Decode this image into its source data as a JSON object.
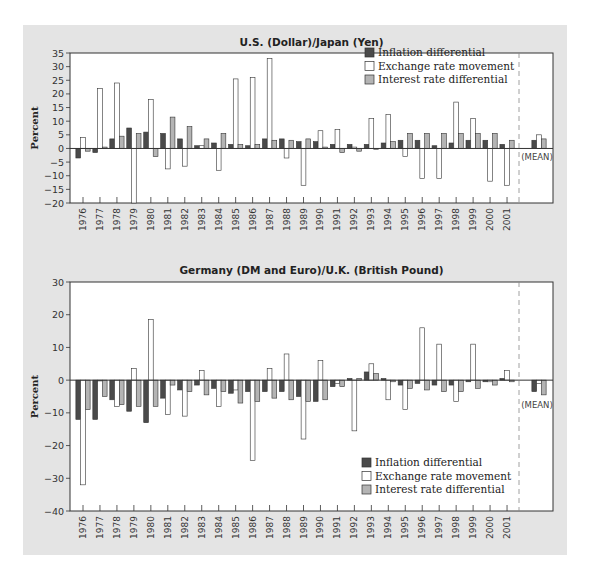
{
  "colors": {
    "inflation": "#4a4a4a",
    "exchange": "#ffffff",
    "interest": "#b4b4b4",
    "panel": "#e4e4e4",
    "outline": "#333333"
  },
  "chart_data": [
    {
      "type": "bar",
      "title": "U.S. (Dollar)/Japan (Yen)",
      "xlabel": "",
      "ylabel": "Percent",
      "ylim": [
        -20,
        35
      ],
      "yticks": [
        35,
        30,
        25,
        20,
        15,
        10,
        5,
        0,
        -5,
        -10,
        -15,
        -20
      ],
      "grid": false,
      "legend_position": "top-right",
      "mean_label": "(MEAN)",
      "categories": [
        "1976",
        "1977",
        "1978",
        "1979",
        "1980",
        "1981",
        "1982",
        "1983",
        "1984",
        "1985",
        "1986",
        "1987",
        "1988",
        "1989",
        "1990",
        "1991",
        "1992",
        "1993",
        "1994",
        "1995",
        "1996",
        "1997",
        "1998",
        "1999",
        "2000",
        "2001"
      ],
      "series": [
        {
          "name": "Inflation differential",
          "values": [
            -3.5,
            -1.5,
            3.5,
            7.5,
            6,
            5.5,
            3.5,
            1,
            2,
            1.5,
            1,
            3.5,
            3.5,
            2.5,
            2.5,
            1.5,
            1.5,
            1.5,
            2,
            3,
            3,
            1,
            2,
            3,
            3,
            1.5
          ],
          "mean": 3
        },
        {
          "name": "Exchange rate movement",
          "values": [
            4,
            22,
            24,
            -20,
            18,
            -7.5,
            -6.5,
            1,
            -8,
            25.5,
            26,
            33,
            -3.5,
            -13.5,
            6.5,
            7,
            0.5,
            11,
            12.5,
            -3,
            -11,
            -11,
            17,
            11,
            -12,
            -13.5
          ],
          "mean": 5
        },
        {
          "name": "Interest rate differential",
          "values": [
            -1,
            0.5,
            4.5,
            5.5,
            -3,
            11.5,
            8,
            3.5,
            5.5,
            1.5,
            1.5,
            3,
            3,
            3.5,
            0.5,
            -1.5,
            -1,
            0,
            2.5,
            5.5,
            5.5,
            5.5,
            5.5,
            5.5,
            5.5,
            3
          ],
          "mean": 3.5
        }
      ]
    },
    {
      "type": "bar",
      "title": "Germany (DM and Euro)/U.K. (British Pound)",
      "xlabel": "",
      "ylabel": "Percent",
      "ylim": [
        -40,
        30
      ],
      "yticks": [
        30,
        20,
        10,
        0,
        -10,
        -20,
        -30,
        -40
      ],
      "grid": false,
      "legend_position": "bottom-right",
      "mean_label": "(MEAN)",
      "categories": [
        "1976",
        "1977",
        "1978",
        "1979",
        "1980",
        "1981",
        "1982",
        "1983",
        "1984",
        "1985",
        "1986",
        "1987",
        "1988",
        "1989",
        "1990",
        "1991",
        "1992",
        "1993",
        "1994",
        "1995",
        "1996",
        "1997",
        "1998",
        "1999",
        "2000",
        "2001"
      ],
      "series": [
        {
          "name": "Inflation differential",
          "values": [
            -12,
            -12,
            -6,
            -9.5,
            -13,
            -5.5,
            -3,
            -1.5,
            -2.5,
            -4,
            -3.5,
            -3.5,
            -3.5,
            -5,
            -6.5,
            -2,
            0.5,
            2.5,
            0.5,
            -1.5,
            -1,
            -1.5,
            -1.5,
            -0.5,
            -0.5,
            0.5
          ],
          "mean": -3.5
        },
        {
          "name": "Exchange rate movement",
          "values": [
            -32,
            0,
            -8,
            3.5,
            18.5,
            -10.5,
            -11,
            3,
            -8,
            -3,
            -24.5,
            3.5,
            8,
            -18,
            6,
            -1,
            -15.5,
            5,
            -6,
            -9,
            16,
            11,
            -6.5,
            11,
            -0.5,
            3
          ],
          "mean": -1
        },
        {
          "name": "Interest rate differential",
          "values": [
            -9,
            -5,
            -7.5,
            -8,
            -8,
            -1.5,
            -3.5,
            -4.5,
            -3.5,
            -7,
            -6.5,
            -5.5,
            -6,
            -6.5,
            -6,
            -2,
            0.5,
            2,
            -0.5,
            -2.5,
            -3,
            -3.5,
            -3.5,
            -2.5,
            -1.5,
            -0.5
          ],
          "mean": -4.5
        }
      ]
    }
  ]
}
